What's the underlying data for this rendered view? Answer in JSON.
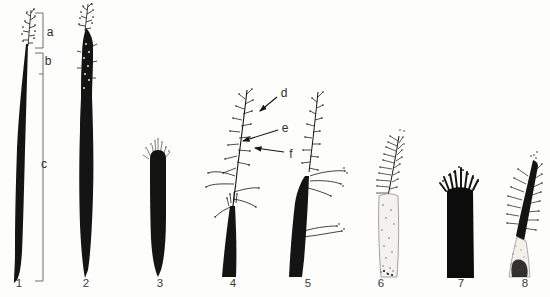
{
  "figure": {
    "background": "#ffffff",
    "ink": "#141414",
    "label_color": "#2e2e2e",
    "bracket_color": "#6e6e6e",
    "stipple_fill": "#f4f2ee",
    "region_labels": {
      "a": "a",
      "b": "b",
      "c": "c"
    },
    "part_labels": {
      "d": "d",
      "e": "e",
      "f": "f"
    },
    "specimen_numbers": [
      "1",
      "2",
      "3",
      "4",
      "5",
      "6",
      "7",
      "8"
    ]
  }
}
